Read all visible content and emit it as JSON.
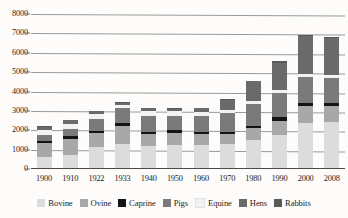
{
  "chart_data": {
    "type": "bar",
    "subtype": "stacked-bar",
    "title": "",
    "xlabel": "",
    "ylabel": "",
    "ylim": [
      0,
      8000
    ],
    "ytick_step": 1000,
    "ytick_labels": [
      "8000",
      "7000",
      "6000",
      "5000",
      "4000",
      "3000",
      "2000",
      "1000",
      "0"
    ],
    "ytick_values": [
      8000,
      7000,
      6000,
      5000,
      4000,
      3000,
      2000,
      1000,
      0
    ],
    "grid": true,
    "grid_axis": "y",
    "legend_position": "bottom",
    "categories": [
      "1900",
      "1910",
      "1922",
      "1933",
      "1940",
      "1950",
      "1960",
      "1970",
      "1980",
      "1990",
      "2000",
      "2008"
    ],
    "series": [
      {
        "name": "Bovine",
        "color": "#dcdcdc",
        "values": [
          620,
          700,
          1150,
          1300,
          1200,
          1250,
          1250,
          1300,
          1500,
          1750,
          2350,
          2450
        ]
      },
      {
        "name": "Ovine",
        "color": "#a8a8a8",
        "values": [
          700,
          870,
          700,
          900,
          600,
          600,
          550,
          500,
          600,
          750,
          900,
          800
        ]
      },
      {
        "name": "Caprine",
        "color": "#141414",
        "values": [
          130,
          130,
          130,
          160,
          130,
          140,
          130,
          130,
          140,
          160,
          180,
          170
        ]
      },
      {
        "name": "Pigs",
        "color": "#7a7a7a",
        "values": [
          330,
          380,
          600,
          800,
          800,
          760,
          800,
          950,
          1100,
          1250,
          1300,
          1280
        ]
      },
      {
        "name": "Equine",
        "color": "#f2f2f2",
        "values": [
          260,
          250,
          240,
          140,
          260,
          220,
          200,
          180,
          160,
          150,
          150,
          150
        ]
      },
      {
        "name": "Hens",
        "color": "#6a6a6a",
        "values": [
          120,
          190,
          150,
          130,
          140,
          150,
          200,
          520,
          1020,
          1430,
          1990,
          1930
        ]
      },
      {
        "name": "Rabbits",
        "color": "#595959",
        "values": [
          40,
          30,
          30,
          20,
          20,
          30,
          20,
          20,
          30,
          60,
          30,
          20
        ]
      }
    ],
    "totals": [
      2200,
      2550,
      3000,
      3450,
      3150,
      3150,
      3150,
      3600,
      4550,
      5550,
      6900,
      6800
    ]
  },
  "legend": {
    "items": [
      {
        "label": "Bovine",
        "color": "#dcdcdc"
      },
      {
        "label": "Ovine",
        "color": "#a8a8a8"
      },
      {
        "label": "Caprine",
        "color": "#141414"
      },
      {
        "label": "Pigs",
        "color": "#7a7a7a"
      },
      {
        "label": "Equine",
        "color": "#f2f2f2"
      },
      {
        "label": "Hens",
        "color": "#6a6a6a"
      },
      {
        "label": "Rabbits",
        "color": "#595959"
      }
    ]
  }
}
